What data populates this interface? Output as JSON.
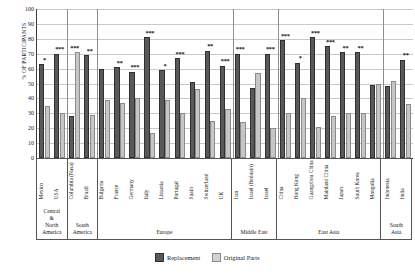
{
  "chart_data": {
    "type": "bar",
    "title": "",
    "xlabel": "",
    "ylabel": "% OF PARTICIPANTS",
    "ylim": [
      0,
      100
    ],
    "ytick_step": 10,
    "yticks": [
      100,
      90,
      80,
      70,
      60,
      50,
      40,
      30,
      20,
      10,
      0
    ],
    "grid": true,
    "legend_position": "bottom-center",
    "categories": [
      "Mexico",
      "USA",
      "Columbia (Nasa)",
      "Brazil",
      "Bulgaria",
      "France",
      "Germany",
      "Italy",
      "Lituania",
      "Portugal",
      "Spain",
      "Switzerland",
      "UK",
      "Iran",
      "Israel (Bedouin)",
      "Israel",
      "China",
      "Hong Kong",
      "Guangzhou China",
      "Mainland China",
      "Japan",
      "South Korea",
      "Mongolia",
      "Indonesia",
      "India"
    ],
    "series": [
      {
        "name": "Replacement",
        "color": "#595959",
        "values": [
          63,
          70,
          28,
          69,
          60,
          61,
          58,
          81,
          59,
          67,
          51,
          72,
          62,
          70,
          47,
          70,
          79,
          64,
          81,
          75,
          71,
          71,
          49,
          48,
          66
        ]
      },
      {
        "name": "Original Parts",
        "color": "#c6c6c6",
        "values": [
          35,
          30,
          71,
          29,
          39,
          37,
          40,
          17,
          39,
          30,
          46,
          25,
          33,
          24,
          57,
          20,
          30,
          40,
          21,
          28,
          30,
          30,
          50,
          52,
          36
        ]
      }
    ],
    "significance": [
      "*",
      "***",
      "***",
      "**",
      "",
      "**",
      "***",
      "***",
      "*",
      "***",
      "",
      "**",
      "***",
      "***",
      "",
      "***",
      "***",
      "*",
      "***",
      "***",
      "**",
      "**",
      "",
      "",
      "**"
    ],
    "regions": [
      {
        "label": "Central\n&\nNorth\nAmerica",
        "span": 2
      },
      {
        "label": "South\nAmerica",
        "span": 2
      },
      {
        "label": "Europe",
        "span": 9
      },
      {
        "label": "Middle East",
        "span": 3
      },
      {
        "label": "East Asia",
        "span": 7
      },
      {
        "label": "South\nAsia",
        "span": 2
      }
    ],
    "legend": [
      {
        "label": "Replacement",
        "swatch": "replacement"
      },
      {
        "label": "Original Parts",
        "swatch": "original"
      }
    ]
  }
}
